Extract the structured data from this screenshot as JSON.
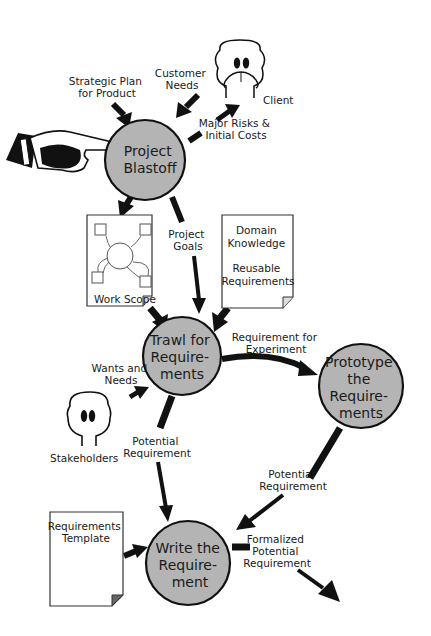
{
  "diagram": {
    "processes": {
      "blastoff": {
        "lines": [
          "Project",
          "Blastoff"
        ]
      },
      "trawl": {
        "lines": [
          "Trawl for",
          "Require-",
          "ments"
        ]
      },
      "prototype": {
        "lines": [
          "Prototype",
          "the",
          "Require-",
          "ments"
        ]
      },
      "write": {
        "lines": [
          "Write the",
          "Require-",
          "ment"
        ]
      }
    },
    "actors": {
      "client": {
        "label": "Client"
      },
      "stakeholders": {
        "label": "Stakeholders"
      }
    },
    "documents": {
      "work_scope": {
        "label": "Work Scope"
      },
      "domain_knowledge": {
        "lines": [
          "Domain",
          "Knowledge",
          "",
          "Reusable",
          "Requirements"
        ]
      },
      "requirements_template": {
        "lines": [
          "Requirements",
          "Template"
        ]
      }
    },
    "flows": {
      "strategic_plan": {
        "lines": [
          "Strategic Plan",
          "for Product"
        ]
      },
      "customer_needs": {
        "lines": [
          "Customer",
          "Needs"
        ]
      },
      "major_risks": {
        "lines": [
          "Major Risks &",
          "Initial Costs"
        ]
      },
      "project_goals": {
        "lines": [
          "Project",
          "Goals"
        ]
      },
      "req_for_experiment": {
        "lines": [
          "Requirement for",
          "Experiment"
        ]
      },
      "wants_needs": {
        "lines": [
          "Wants and",
          "Needs"
        ]
      },
      "potential_req_1": {
        "lines": [
          "Potential",
          "Requirement"
        ]
      },
      "potential_req_2": {
        "lines": [
          "Potential",
          "Requirement"
        ]
      },
      "formalized": {
        "lines": [
          "Formalized",
          "Potential",
          "Requirement"
        ]
      }
    },
    "colors": {
      "process_fill": "#b4b4b4",
      "stroke": "#111111",
      "background": "#ffffff"
    }
  }
}
